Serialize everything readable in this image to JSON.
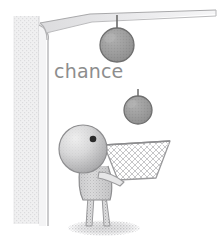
{
  "illustration": {
    "title": "chance",
    "caption": {
      "text": "chance",
      "x": 54,
      "y": 78,
      "color": "#8d8d8d",
      "font_size": 19
    },
    "palette": {
      "background": "#ffffff",
      "wall_fill": "#ececed",
      "wall_outline": "#c9c9cb",
      "ceiling_fill": "#e4e4e6",
      "ceiling_outline": "#b6b6b8",
      "ball_fill": "#9b9b9b",
      "ball_outline": "#6f6f6f",
      "ball_highlight": "#b4b4b4",
      "arrow_color": "#6a6a6a",
      "figure_fill": "#d9d9da",
      "figure_shade": "#a6a6a8",
      "figure_outline": "#8e8e90",
      "eye_color": "#2b2b2b",
      "net_mesh": "#b9b9bb",
      "net_outline": "#9a9a9c",
      "shadow_color": "#bdbdbf",
      "caption_color": "#8d8d8d"
    },
    "elements": [
      {
        "name": "wall-pillar",
        "kind": "vertical wall at left edge with speckled gray texture",
        "x": 14,
        "y": 14,
        "width": 26,
        "height": 212
      },
      {
        "name": "ceiling-slab",
        "kind": "tapering horizontal ceiling wedge across the top",
        "x": 36,
        "y": 10,
        "width": 182,
        "height": 28
      },
      {
        "name": "corner-join",
        "kind": "curved bevel connecting wall to ceiling",
        "x": 36,
        "y": 20,
        "width": 30,
        "height": 50
      },
      {
        "name": "falling-ball-upper",
        "kind": "shaded sphere falling from ceiling",
        "cx": 117,
        "cy": 44,
        "r": 17
      },
      {
        "name": "falling-ball-lower",
        "kind": "shaded sphere falling mid-air",
        "cx": 138,
        "cy": 110,
        "r": 14
      },
      {
        "name": "arrow-upper",
        "kind": "downward motion arrow into upper ball",
        "x": 117,
        "y": 14,
        "length": 32
      },
      {
        "name": "arrow-lower",
        "kind": "downward motion arrow into lower ball",
        "x": 138,
        "y": 88,
        "length": 24
      },
      {
        "name": "catcher-figure",
        "kind": "stick figure with large round head, one eye, torso, arm and two legs",
        "head_cx": 83,
        "head_cy": 149,
        "head_r": 24
      },
      {
        "name": "figure-eye",
        "kind": "single dark round eye on head, upper right",
        "cx": 93,
        "cy": 139,
        "r": 3.2
      },
      {
        "name": "catch-net",
        "kind": "trapezoidal mesh net held out by the figure to catch the balls",
        "x": 104,
        "y": 143,
        "width": 66,
        "height": 38
      },
      {
        "name": "ground-shadow",
        "kind": "soft elliptical shadow beneath the figure",
        "cx": 104,
        "cy": 228,
        "rx": 36,
        "ry": 7
      }
    ]
  }
}
